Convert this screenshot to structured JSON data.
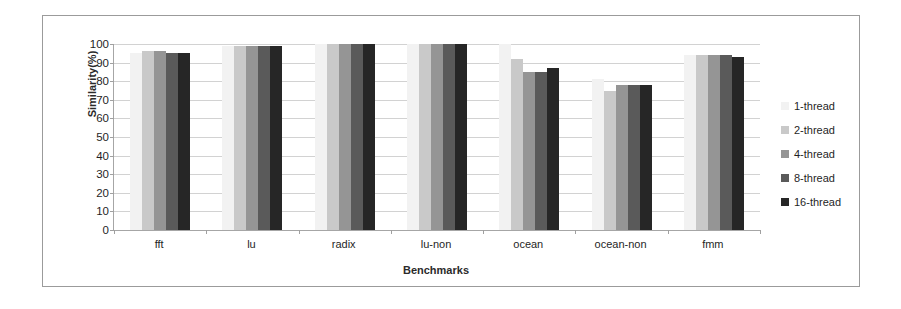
{
  "chart_data": {
    "type": "bar",
    "title": "",
    "xlabel": "Benchmarks",
    "ylabel": "Similarity(%)",
    "ylim": [
      0,
      100
    ],
    "ytick_step": 10,
    "yticks": [
      100,
      90,
      80,
      70,
      60,
      50,
      40,
      30,
      20,
      10,
      0
    ],
    "grid": true,
    "legend_position": "right",
    "categories": [
      "fft",
      "lu",
      "radix",
      "lu-non",
      "ocean",
      "ocean-non",
      "fmm"
    ],
    "series": [
      {
        "name": "1-thread",
        "color": "#f2f2f2",
        "values": [
          95,
          99,
          100,
          100,
          100,
          81,
          94
        ]
      },
      {
        "name": "2-thread",
        "color": "#c9c9c9",
        "values": [
          96,
          99,
          100,
          100,
          92,
          75,
          94
        ]
      },
      {
        "name": "4-thread",
        "color": "#959595",
        "values": [
          96,
          99,
          100,
          100,
          85,
          78,
          94
        ]
      },
      {
        "name": "8-thread",
        "color": "#5a5a5a",
        "values": [
          95,
          99,
          100,
          100,
          85,
          78,
          94
        ]
      },
      {
        "name": "16-thread",
        "color": "#262626",
        "values": [
          95,
          99,
          100,
          100,
          87,
          78,
          93
        ]
      }
    ]
  }
}
